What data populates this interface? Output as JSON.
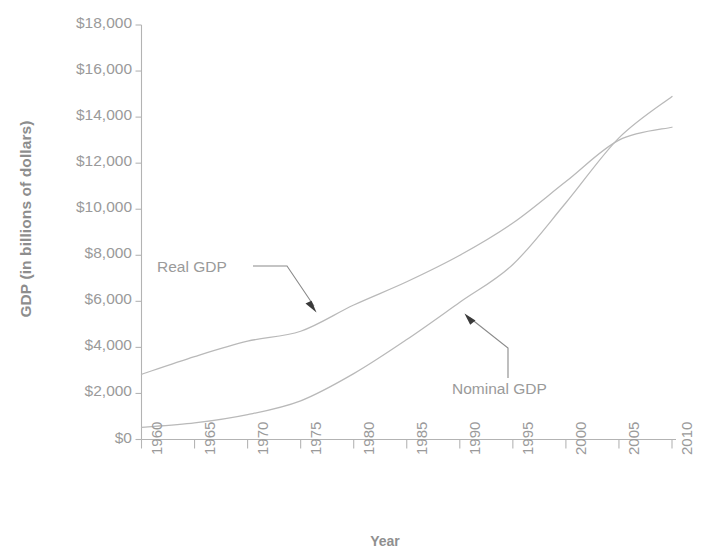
{
  "chart_data": {
    "type": "line",
    "title": "",
    "xlabel": "Year",
    "ylabel": "GDP (in billions of dollars)",
    "x": [
      1960,
      1965,
      1970,
      1975,
      1980,
      1985,
      1990,
      1995,
      2000,
      2005,
      2010
    ],
    "xlim": [
      1960,
      2010
    ],
    "ylim": [
      0,
      18000
    ],
    "grid": false,
    "legend_position": "inline-annotations",
    "x_tick_labels": [
      "1960",
      "1965",
      "1970",
      "1975",
      "1980",
      "1985",
      "1990",
      "1995",
      "2000",
      "2005",
      "2010"
    ],
    "y_tick_labels": [
      "$0",
      "$2,000",
      "$4,000",
      "$6,000",
      "$8,000",
      "$10,000",
      "$12,000",
      "$14,000",
      "$16,000",
      "$18,000"
    ],
    "y_tick_values": [
      0,
      2000,
      4000,
      6000,
      8000,
      10000,
      12000,
      14000,
      16000,
      18000
    ],
    "series": [
      {
        "name": "Real GDP",
        "color": "#b9b9b9",
        "values": [
          2830,
          3600,
          4270,
          4700,
          5840,
          6850,
          8000,
          9400,
          11200,
          13000,
          13560
        ]
      },
      {
        "name": "Nominal GDP",
        "color": "#b9b9b9",
        "values": [
          530,
          720,
          1080,
          1680,
          2860,
          4340,
          5960,
          7600,
          10280,
          13100,
          14900
        ]
      }
    ],
    "annotations": [
      {
        "text": "Real GDP",
        "points_to_series": "Real GDP",
        "points_to_x": 1977
      },
      {
        "text": "Nominal GDP",
        "points_to_series": "Nominal GDP",
        "points_to_x": 1988
      }
    ]
  },
  "axis": {
    "x_title": "Year",
    "y_title": "GDP (in billions of dollars)"
  },
  "annotations": {
    "real_gdp": "Real GDP",
    "nominal_gdp": "Nominal GDP"
  }
}
